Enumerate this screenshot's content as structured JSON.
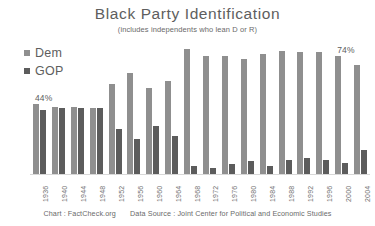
{
  "chart_data": {
    "type": "bar",
    "title": "Black Party Identification",
    "subtitle": "(includes independents who lean D or R)",
    "xlabel": "",
    "ylabel": "",
    "ylim": [
      0,
      80
    ],
    "grid": false,
    "legend_position": "top-left",
    "categories": [
      "1936",
      "1940",
      "1944",
      "1948",
      "1952",
      "1956",
      "1960",
      "1964",
      "1968",
      "1972",
      "1976",
      "1980",
      "1984",
      "1988",
      "1992",
      "1996",
      "2000",
      "2004"
    ],
    "series": [
      {
        "name": "Dem",
        "color": "#8f8f8f",
        "values": [
          44,
          42,
          42,
          41,
          56,
          63,
          54,
          58,
          78,
          74,
          74,
          72,
          75,
          77,
          76,
          76,
          74,
          68
        ]
      },
      {
        "name": "GOP",
        "color": "#5c5c5c",
        "values": [
          40,
          41,
          41,
          41,
          28,
          22,
          30,
          24,
          5,
          4,
          6,
          8,
          5,
          9,
          10,
          9,
          7,
          15
        ]
      }
    ],
    "annotations": [
      {
        "text": "44%",
        "category": "1936",
        "series": "Dem"
      },
      {
        "text": "74%",
        "category": "2000",
        "series": "Dem"
      }
    ]
  },
  "footer": {
    "chart_credit": "Chart : FactCheck.org",
    "data_source": "Data Source :  Joint Center for Political and Economic Studies"
  }
}
